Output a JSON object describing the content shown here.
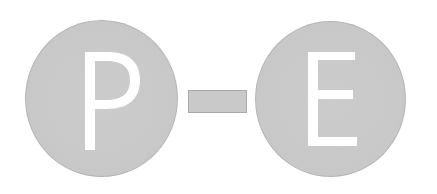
{
  "logo": {
    "left_letter": "P",
    "separator": "-",
    "right_letter": "E",
    "text": "P-E"
  },
  "colors": {
    "background": "#ffffff",
    "circle_fill": "#c9c9c9",
    "circle_edge": "#b4b4b4",
    "dash_fill": "#c9c9c9",
    "dash_border": "#a9a9a9",
    "letter": "#ffffff"
  }
}
